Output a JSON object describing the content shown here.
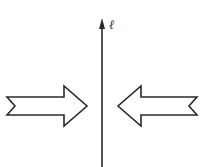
{
  "diagram": {
    "line_label": "ℓ",
    "stroke_color": "#2a2a2a",
    "fill_color": "#ffffff",
    "arrows": [
      {
        "name": "left-arrow",
        "direction": "right"
      },
      {
        "name": "right-arrow",
        "direction": "left"
      }
    ]
  }
}
